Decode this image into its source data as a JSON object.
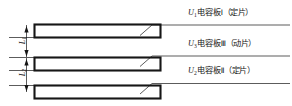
{
  "figure": {
    "type": "schematic-diagram",
    "background_color": "#ffffff",
    "line_color": "#161616"
  },
  "plates": [
    {
      "id": "plate-1",
      "label_voltage": "U",
      "label_voltage_sub": "1",
      "label_text": "电容板",
      "label_roman": "Ⅰ",
      "label_paren": "（定片）",
      "label_full": "U1电容板Ⅰ（定片）",
      "x": 34,
      "y": 24,
      "w": 126,
      "h": 13
    },
    {
      "id": "plate-2",
      "label_voltage": "U",
      "label_voltage_sub": "3",
      "label_text": "电容板",
      "label_roman": "Ⅲ",
      "label_paren": "（动片）",
      "label_full": "U3电容板Ⅲ（动片）",
      "x": 34,
      "y": 57,
      "w": 126,
      "h": 13
    },
    {
      "id": "plate-3",
      "label_voltage": "U",
      "label_voltage_sub": "2",
      "label_text": "电容板",
      "label_roman": "Ⅱ",
      "label_paren": "（定片）",
      "label_full": "U2电容板Ⅱ（定片）",
      "x": 34,
      "y": 85,
      "w": 126,
      "h": 13
    }
  ],
  "dimensions": [
    {
      "id": "gap-1",
      "symbol": "L",
      "sub": "1",
      "text": "L1"
    },
    {
      "id": "gap-2",
      "symbol": "L",
      "sub": "2",
      "text": "L2"
    }
  ]
}
